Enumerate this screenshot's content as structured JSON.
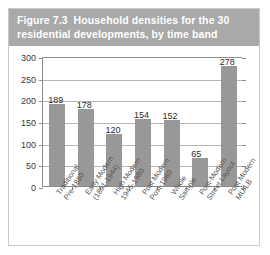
{
  "figure": {
    "number": "Figure 7.3",
    "title_line1": "Household densities for the 30",
    "title_line2": "residential developments, by time band"
  },
  "chart_data": {
    "type": "bar",
    "xlabel": "",
    "ylabel": "",
    "ylim": [
      0,
      300
    ],
    "yticks": [
      0,
      50,
      100,
      150,
      200,
      250,
      300
    ],
    "grid": true,
    "legend": "none",
    "bar_color": "#989898",
    "categories": [
      "Traditional Pre-1890",
      "Early Modern (1891-1944)",
      "High Modern 1945-1980",
      "Post Modern Post-1980",
      "Whole Sample",
      "Post-Modern Street Layout",
      "Post Modern MU/LB"
    ],
    "category_lines": [
      [
        "Traditional",
        "Pre-1890"
      ],
      [
        "Early Modern",
        "(1891-1944)"
      ],
      [
        "High Modern",
        "1945-1980"
      ],
      [
        "Post Modern",
        "Post-1980"
      ],
      [
        "Whole",
        "Sample"
      ],
      [
        "Post-Modern",
        "Street Layout"
      ],
      [
        "Post Modern",
        "MU/LB"
      ]
    ],
    "values": [
      189,
      178,
      120,
      154,
      152,
      65,
      278
    ],
    "value_labels": [
      "189",
      "178",
      "120",
      "154",
      "152",
      "65",
      "278"
    ]
  }
}
